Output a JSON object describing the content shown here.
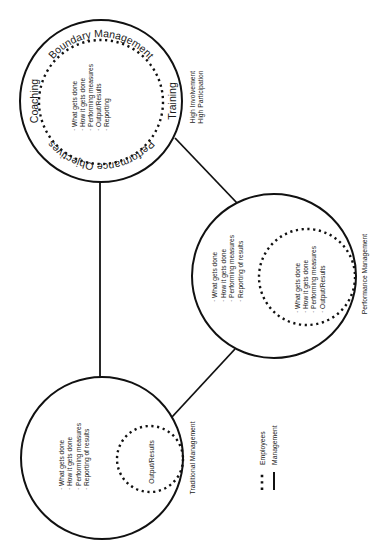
{
  "diagram": {
    "orientation": "rotated 90 degrees counter-clockwise",
    "models": [
      {
        "id": "high-involvement",
        "outer_ring_labels": {
          "top": "Boundary Management",
          "left": "Coaching",
          "right": "Training",
          "bottom": "Performance Objectives"
        },
        "items": [
          "· What gets done",
          "· How it gets done",
          "· Performing measures",
          "· Output/Results",
          "· Reporting"
        ],
        "caption_lines": [
          "High Involvement",
          "High Participation"
        ]
      },
      {
        "id": "performance-management",
        "outer_items": [
          "· What gets done",
          "· How it gets done",
          "· Performing measures",
          "· Reporting of results"
        ],
        "inner_items": [
          "· What gets done",
          "· How it gets done",
          "· Performing measures",
          "· Output/Results"
        ],
        "caption": "Performance Management"
      },
      {
        "id": "traditional-management",
        "outer_items": [
          "· What gets done",
          "· How it gets done",
          "· Performing measures",
          "· Reporting of results"
        ],
        "inner_label": "Output/Results",
        "caption": "Traditional Management"
      }
    ],
    "legend": [
      {
        "style": "dotted",
        "label": "Employees"
      },
      {
        "style": "solid",
        "label": "Management"
      }
    ],
    "colors": {
      "line": "#111111",
      "text": "#1a1a1a",
      "background": "#ffffff"
    }
  }
}
